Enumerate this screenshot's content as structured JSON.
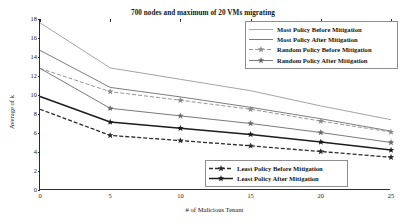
{
  "chart_data": {
    "type": "line",
    "title": "700 nodes and maximum of 20 VMs migrating",
    "xlabel": "# of Malicious Tenant",
    "ylabel": "Average of k",
    "x": [
      0,
      5,
      10,
      15,
      20,
      25
    ],
    "xlim": [
      0,
      25
    ],
    "ylim": [
      0,
      18
    ],
    "xticks": [
      "0",
      "5",
      "10",
      "15",
      "20",
      "25"
    ],
    "yticks": [
      "0",
      "2",
      "4",
      "6",
      "8",
      "10",
      "12",
      "14",
      "16",
      "18"
    ],
    "grid": false,
    "legend_position": "top-right and bottom-right",
    "series": [
      {
        "name": "Most Policy Before Mitigation",
        "values": [
          17.6,
          12.85,
          11.65,
          10.45,
          8.85,
          7.4
        ],
        "color": "#9a9a9a",
        "dash": "none",
        "marker": "none",
        "width": 0.9
      },
      {
        "name": "Most Policy After Mitigation",
        "values": [
          14.7,
          10.8,
          9.8,
          8.7,
          7.5,
          6.2
        ],
        "color": "#6e6e6e",
        "dash": "none",
        "marker": "none",
        "width": 0.9
      },
      {
        "name": "Random Policy Before Mitigation",
        "values": [
          12.8,
          10.35,
          9.45,
          8.5,
          7.25,
          6.1
        ],
        "color": "#8a8a8a",
        "dash": "4,2",
        "marker": "star",
        "width": 0.9
      },
      {
        "name": "Random Policy After Mitigation",
        "values": [
          12.8,
          8.6,
          7.8,
          7.0,
          6.05,
          5.0
        ],
        "color": "#6a6a6a",
        "dash": "none",
        "marker": "star",
        "width": 0.9
      },
      {
        "name": "Least Policy Before Mitigation",
        "values": [
          8.5,
          5.75,
          5.2,
          4.65,
          4.05,
          3.45
        ],
        "color": "#2b2b2b",
        "dash": "4,2",
        "marker": "star",
        "width": 1.3
      },
      {
        "name": "Least Policy After Mitigation",
        "values": [
          9.85,
          7.15,
          6.5,
          5.85,
          5.05,
          4.2
        ],
        "color": "#1c1c1c",
        "dash": "none",
        "marker": "star",
        "width": 1.5
      }
    ]
  },
  "legend_top": {
    "entries": [
      "Most Policy Before Mitigation",
      "Most Policy After Mitigation",
      "Random Policy Before Mitigation",
      "Random Policy After Mitigation"
    ]
  },
  "legend_bottom": {
    "entries": [
      "Least Policy Before Mitigation",
      "Least Policy After Mitigation"
    ]
  }
}
